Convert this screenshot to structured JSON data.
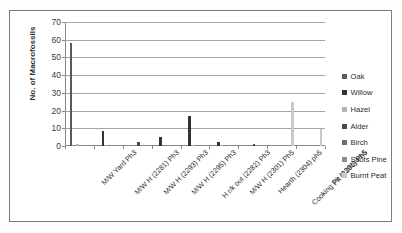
{
  "chart_data": {
    "type": "bar",
    "title": "",
    "xlabel": "",
    "ylabel": "No. of Macrofossils",
    "ylim": [
      0,
      70
    ],
    "yticks": [
      0,
      10,
      20,
      30,
      40,
      50,
      60,
      70
    ],
    "grid": true,
    "legend_position": "right",
    "categories": [
      "M/W Yard Ph3",
      "M/W H (2281) Ph3",
      "M/W H (2293) Ph3",
      "M/W H (2295) Ph3",
      "H r/k out (2282) Ph3",
      "M/W H (2301) Ph5",
      "Hearth (2304) ph5",
      "Cooking Pit (2291) Ph5",
      "Pit (2300) Ph5"
    ],
    "series": [
      {
        "name": "Oak",
        "color": "#5a5a5a",
        "values": [
          58,
          0,
          0,
          0,
          0,
          0,
          0,
          0,
          0
        ]
      },
      {
        "name": "Willow",
        "color": "#333333",
        "values": [
          0,
          8.5,
          0,
          5.2,
          17.2,
          2,
          0,
          0,
          0
        ]
      },
      {
        "name": "Hazel",
        "color": "#b5b5b5",
        "values": [
          1,
          0.4,
          0,
          0,
          0.8,
          0.5,
          0,
          0,
          0
        ]
      },
      {
        "name": "Alder",
        "color": "#4a4a4a",
        "values": [
          0,
          0,
          2,
          0,
          0,
          0,
          1,
          0,
          0
        ]
      },
      {
        "name": "Birch",
        "color": "#6e6e6e",
        "values": [
          0,
          0,
          0,
          0,
          0,
          0,
          0,
          0,
          0
        ]
      },
      {
        "name": "Scots Pine",
        "color": "#8c8c8c",
        "values": [
          0,
          0,
          0,
          0,
          0,
          0,
          0,
          0,
          0
        ]
      },
      {
        "name": "Burnt Peat",
        "color": "#c9c9c9",
        "values": [
          0,
          0,
          0,
          0,
          0,
          0,
          0,
          25,
          9.5
        ]
      }
    ]
  },
  "legend": {
    "items": [
      {
        "label": "Oak"
      },
      {
        "label": "Willow"
      },
      {
        "label": "Hazel"
      },
      {
        "label": "Alder"
      },
      {
        "label": "Birch"
      },
      {
        "label": "Scots Pine"
      },
      {
        "label": "Burnt Peat"
      }
    ]
  }
}
